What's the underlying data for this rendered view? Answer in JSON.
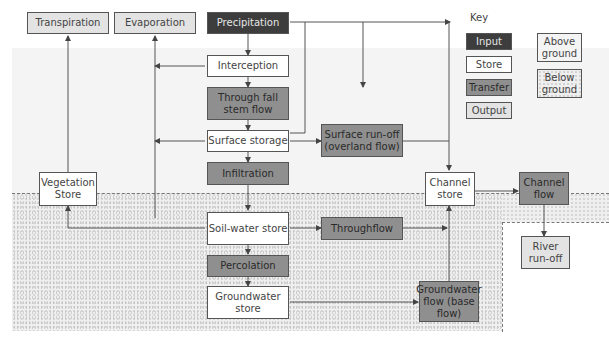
{
  "key": {
    "title": "Key",
    "input": "Input",
    "store": "Store",
    "transfer": "Transfer",
    "output": "Output",
    "above_ground": "Above ground",
    "below_ground": "Below ground"
  },
  "nodes": {
    "transpiration": "Transpiration",
    "evaporation": "Evaporation",
    "precipitation": "Precipitation",
    "interception": "Interception",
    "through_fall": "Through fall stem flow",
    "surface_storage": "Surface storage",
    "surface_runoff": "Surface run-off (overland flow)",
    "infiltration": "Infiltration",
    "vegetation_store": "Vegetation Store",
    "channel_store": "Channel store",
    "channel_flow": "Channel flow",
    "river_runoff": "River run-off",
    "soil_water_store": "Soil-water store",
    "throughflow": "Throughflow",
    "percolation": "Percolation",
    "groundwater_store": "Groundwater store",
    "groundwater_flow": "Groundwater flow (base flow)"
  },
  "colors": {
    "input": "#3d3d3d",
    "store": "#ffffff",
    "transfer": "#8f8f8f",
    "output": "#e3e3e3",
    "above_ground": "#f4f4f4",
    "below_ground": "#efefef"
  }
}
